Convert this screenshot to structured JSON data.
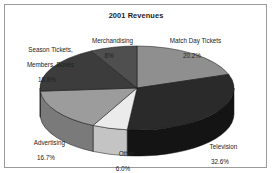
{
  "figure": {
    "title": "2001 Revenues",
    "border_color": "#9a9a9a",
    "background": "#ffffff"
  },
  "chart_data": {
    "type": "pie",
    "title": "2001 Revenues",
    "xlabel": "",
    "ylabel": "",
    "legend_position": "none",
    "labels_outside": true,
    "three_d": true,
    "categories": [
      "Match Day Tickets",
      "Television",
      "Other",
      "Advertising",
      "Season Tickets, Members, Boxes",
      "Merchandising"
    ],
    "values": [
      20.2,
      32.6,
      6.0,
      16.7,
      18.8,
      8.0
    ],
    "value_labels": [
      "20.2%",
      "32.6%",
      "6.0%",
      "16.7%",
      "18.8%",
      "8%"
    ],
    "units": "percent",
    "colors": [
      "#8f8f8f",
      "#2a2a2a",
      "#ebebeb",
      "#9c9c9c",
      "#3c3c3c",
      "#4f4f4f"
    ],
    "slices": [
      {
        "name": "Match Day Tickets",
        "label": "Match Day Tickets",
        "percent_label": "20.2%",
        "value": 20.2,
        "color": "#8f8f8f",
        "side_color": "#6e6e6e"
      },
      {
        "name": "Television",
        "label": "Television",
        "percent_label": "32.6%",
        "value": 32.6,
        "color": "#2a2a2a",
        "side_color": "#141414"
      },
      {
        "name": "Other",
        "label": "Other",
        "percent_label": "6.0%",
        "value": 6.0,
        "color": "#ebebeb",
        "side_color": "#c4c4c4"
      },
      {
        "name": "Advertising",
        "label": "Advertising",
        "percent_label": "16.7%",
        "value": 16.7,
        "color": "#9c9c9c",
        "side_color": "#7a7a7a"
      },
      {
        "name": "Season Tickets, Members, Boxes",
        "label": "Season Tickets,\nMembers, Boxes",
        "percent_label": "18.8%",
        "value": 18.8,
        "color": "#3c3c3c",
        "side_color": "#232323"
      },
      {
        "name": "Merchandising",
        "label": "Merchandising",
        "percent_label": "8%",
        "value": 8.0,
        "color": "#4f4f4f",
        "side_color": "#303030"
      }
    ]
  }
}
